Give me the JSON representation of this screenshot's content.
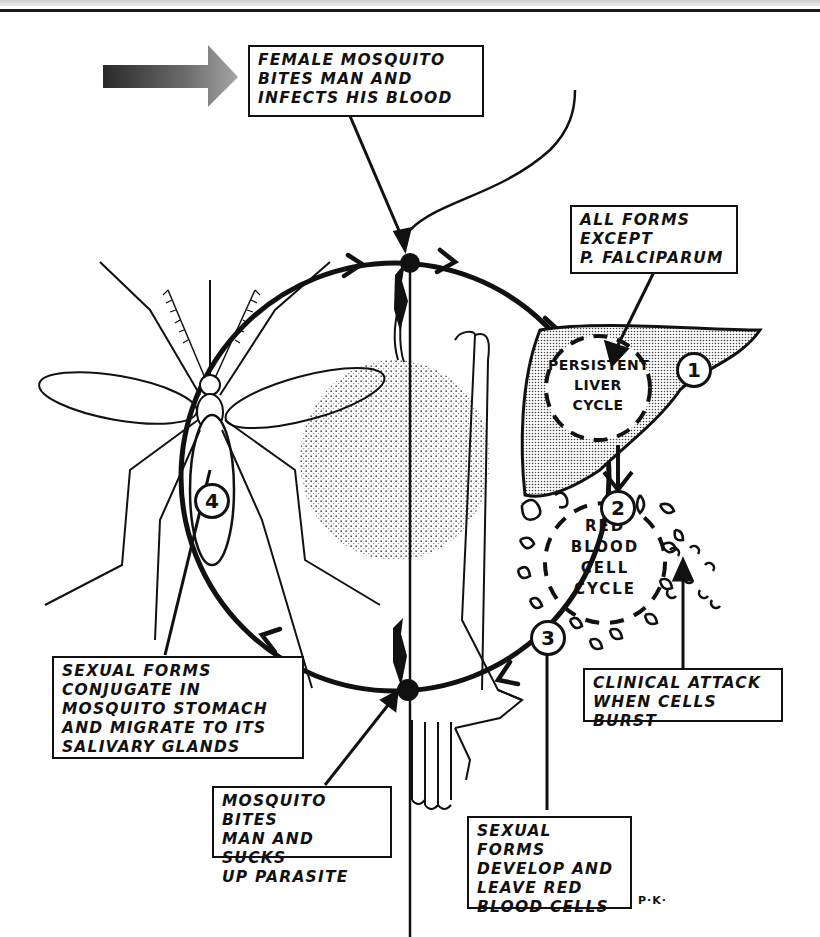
{
  "diagram": {
    "colors": {
      "ink": "#111111",
      "paper": "#ffffff",
      "stipple": "#777777"
    },
    "callouts": {
      "infection": "FEMALE MOSQUITO\nBITES MAN AND\nINFECTS HIS BLOOD",
      "except_falciparum": "ALL FORMS\nEXCEPT\nP. FALCIPARUM",
      "mosquito_stage": "SEXUAL FORMS\nCONJUGATE IN\nMOSQUITO STOMACH\nAND MIGRATE TO ITS\nSALIVARY GLANDS",
      "bite_sucks": "MOSQUITO BITES\nMAN AND SUCKS\nUP PARASITE",
      "sexual_forms": "SEXUAL FORMS\nDEVELOP AND\nLEAVE RED\nBLOOD CELLS",
      "clinical_attack": "CLINICAL ATTACK\nWHEN CELLS BURST"
    },
    "cycles": {
      "liver": "PERSISTENT\nLIVER\nCYCLE",
      "red_blood": "RED\nBLOOD\nCELL\nCYCLE"
    },
    "steps": [
      "1",
      "2",
      "3",
      "4"
    ],
    "signature": "P·K·",
    "icons": [
      "direction-arrow-icon",
      "mosquito-icon",
      "human-arm-icon",
      "liver-icon",
      "blood-cells-icon"
    ]
  }
}
